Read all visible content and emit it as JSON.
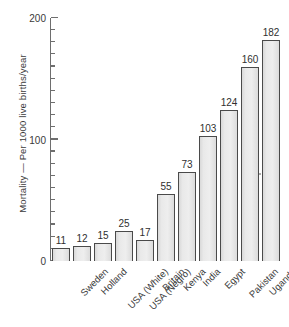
{
  "chart_data": {
    "type": "bar",
    "title": "",
    "xlabel": "",
    "ylabel": "Mortality — Per 1000 live births/year",
    "ylim": [
      0,
      200
    ],
    "ytick_labels": [
      "0",
      "100",
      "200"
    ],
    "ytick_values": [
      0,
      100,
      200
    ],
    "minor_tick_step": 10,
    "grid": false,
    "legend": "none",
    "categories": [
      "Sweden",
      "Holland",
      "USA (White)",
      "USA (Negro)",
      "Britain",
      "Kenya",
      "India",
      "Egypt",
      "Pakistan",
      "Uganda",
      "Upper Volta"
    ],
    "values": [
      11,
      12,
      15,
      25,
      17,
      55,
      73,
      103,
      124,
      160,
      182
    ],
    "value_labels": [
      "11",
      "12",
      "15",
      "25",
      "17",
      "55",
      "73",
      "103",
      "124",
      "160",
      "182"
    ],
    "bar_fill_color": "#ebebeb",
    "bar_border_color": "#4a4a4a",
    "axis_color": "#6e6e6e",
    "text_color": "#3a3a3a"
  }
}
